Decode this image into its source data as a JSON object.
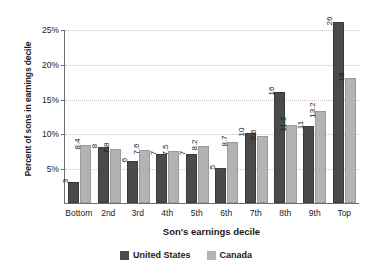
{
  "chart_data": {
    "type": "bar",
    "title": "",
    "xlabel": "Son's earnings decile",
    "ylabel": "Percent of sons in earnings decile",
    "categories": [
      "Bottom",
      "2nd",
      "3rd",
      "4th",
      "5th",
      "6th",
      "7th",
      "8th",
      "9th",
      "Top"
    ],
    "series": [
      {
        "name": "United States",
        "color": "#4a4a4a",
        "values": [
          3,
          8,
          6,
          7,
          7,
          5,
          10,
          16,
          11,
          26
        ],
        "labels": [
          "3",
          "8",
          "6",
          "7",
          "7",
          "5",
          "10",
          "16",
          "11",
          "26"
        ]
      },
      {
        "name": "Canada",
        "color": "#b3b3b3",
        "values": [
          8.4,
          7.8,
          7.6,
          7.5,
          8.2,
          8.7,
          9.6,
          11.2,
          13.2,
          18
        ],
        "labels": [
          "8.4",
          "7.8",
          "7.6",
          "7.5",
          "8.2",
          "8.7",
          "9.6",
          "11.2",
          "13.2",
          "18"
        ]
      }
    ],
    "ylim": [
      0,
      25
    ],
    "yticks": [
      5,
      10,
      15,
      20,
      25
    ],
    "ytick_labels": [
      "5%",
      "10%",
      "15%",
      "20%",
      "25%"
    ],
    "grid": true,
    "legend_position": "bottom"
  },
  "legend": {
    "items": [
      {
        "label": "United States"
      },
      {
        "label": "Canada"
      }
    ]
  }
}
